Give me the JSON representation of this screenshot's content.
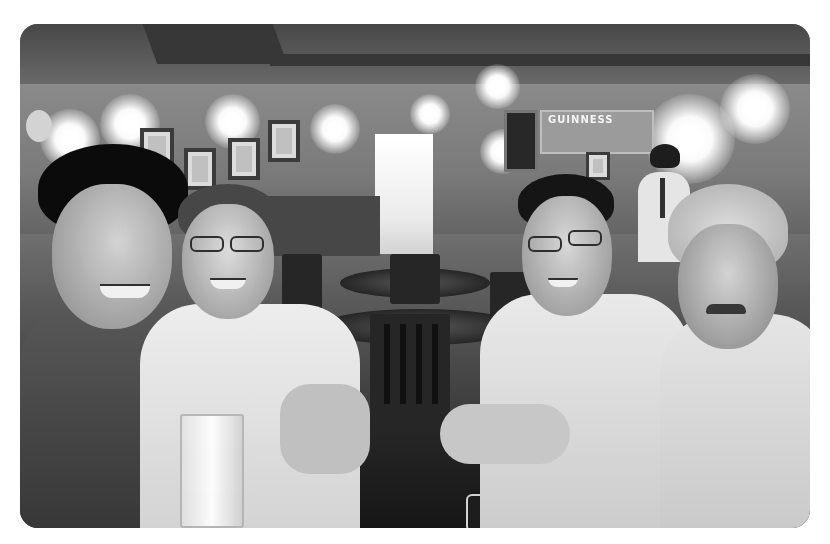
{
  "photo": {
    "description": "Black-and-white photograph of four smiling men seated around a table in a dimly lit pub",
    "style": "grayscale",
    "colors": {
      "border": "#ffffff",
      "dark": "#1a1a1a",
      "mid": "#7a7a7a",
      "highlight": "#ffffff"
    },
    "background_elements": {
      "sign_text": "GUINNESS",
      "wall_frames_count": 4,
      "ceiling_lights_count": 9
    },
    "subjects": [
      {
        "position": "far-left",
        "description": "man with short dark hair, smiling, dark polo shirt"
      },
      {
        "position": "center-left",
        "description": "man with glasses and graying hair, light shirt"
      },
      {
        "position": "center-right",
        "description": "man with glasses, short dark hair, light button shirt"
      },
      {
        "position": "far-right",
        "description": "man with gray hair and mustache, light shirt"
      }
    ]
  }
}
